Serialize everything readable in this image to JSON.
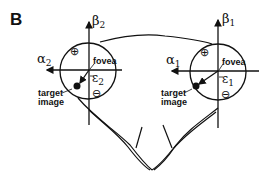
{
  "figure": {
    "panel_label": "B",
    "stroke_color": "#111111",
    "background": "#ffffff"
  },
  "left_eye": {
    "horizontal_axis": {
      "symbol": "α",
      "subscript": "2"
    },
    "vertical_axis": {
      "symbol": "β",
      "subscript": "2"
    },
    "error_vector": {
      "symbol": "ε",
      "subscript": "2"
    },
    "fovea_label": "fovea",
    "target_label_line1": "target",
    "target_label_line2": "image",
    "plus_sign": "⊕",
    "minus_sign": "⊖"
  },
  "right_eye": {
    "horizontal_axis": {
      "symbol": "α",
      "subscript": "1"
    },
    "vertical_axis": {
      "symbol": "β",
      "subscript": "1"
    },
    "error_vector": {
      "symbol": "ε",
      "subscript": "1"
    },
    "fovea_label": "fovea",
    "target_label_line1": "target",
    "target_label_line2": "image",
    "plus_sign": "⊕",
    "minus_sign": "⊖"
  }
}
